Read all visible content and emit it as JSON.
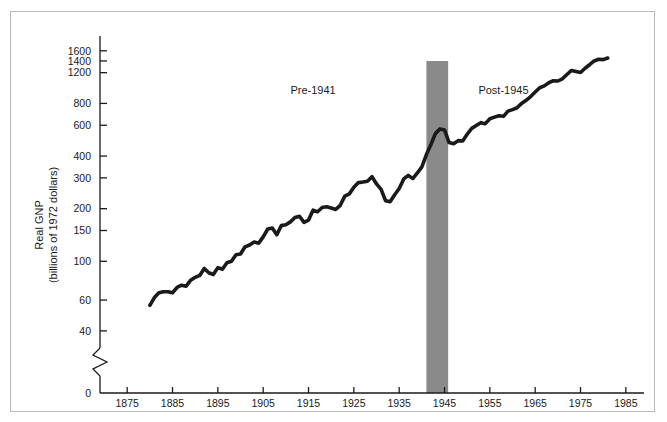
{
  "chart_data": {
    "type": "line",
    "title": "",
    "xlabel": "",
    "ylabel": "Real GNP",
    "ylabel_line2": "(billions of 1972 dollars)",
    "yscale": "log",
    "y_axis_break": true,
    "y_break_note": "axis broken between 0 and 40",
    "ylim": [
      35,
      1750
    ],
    "xlim": [
      1869,
      1989
    ],
    "grid": false,
    "legend": false,
    "yticks": [
      40,
      60,
      100,
      150,
      200,
      300,
      400,
      600,
      800,
      1200,
      1400,
      1600
    ],
    "ytick_labels": [
      "40",
      "60",
      "100",
      "150",
      "200",
      "300",
      "400",
      "600",
      "800",
      "1200",
      "1400",
      "1600"
    ],
    "y_zero_label": "0",
    "xticks": [
      1875,
      1885,
      1895,
      1905,
      1915,
      1925,
      1935,
      1945,
      1955,
      1965,
      1975,
      1985
    ],
    "xtick_labels": [
      "1875",
      "1885",
      "1895",
      "1905",
      "1915",
      "1925",
      "1935",
      "1945",
      "1955",
      "1965",
      "1975",
      "1985"
    ],
    "line_color": "#1a1a1a",
    "line_width": 3.6,
    "annotations": [
      {
        "text": "Pre-1941",
        "x": 1916,
        "y": 900,
        "name": "annotation-pre-1941"
      },
      {
        "text": "Post-1945",
        "x": 1958,
        "y": 900,
        "name": "annotation-post-1945"
      }
    ],
    "shaded_regions": [
      {
        "name": "wwii-band",
        "x_start": 1941,
        "x_end": 1945.8,
        "color": "#8a8a8a",
        "label": ""
      }
    ],
    "x": [
      1880,
      1881,
      1882,
      1883,
      1884,
      1885,
      1886,
      1887,
      1888,
      1889,
      1890,
      1891,
      1892,
      1893,
      1894,
      1895,
      1896,
      1897,
      1898,
      1899,
      1900,
      1901,
      1902,
      1903,
      1904,
      1905,
      1906,
      1907,
      1908,
      1909,
      1910,
      1911,
      1912,
      1913,
      1914,
      1915,
      1916,
      1917,
      1918,
      1919,
      1920,
      1921,
      1922,
      1923,
      1924,
      1925,
      1926,
      1927,
      1928,
      1929,
      1930,
      1931,
      1932,
      1933,
      1934,
      1935,
      1936,
      1937,
      1938,
      1939,
      1940,
      1941,
      1942,
      1943,
      1944,
      1945,
      1946,
      1947,
      1948,
      1949,
      1950,
      1951,
      1952,
      1953,
      1954,
      1955,
      1956,
      1957,
      1958,
      1959,
      1960,
      1961,
      1962,
      1963,
      1964,
      1965,
      1966,
      1967,
      1968,
      1969,
      1970,
      1971,
      1972,
      1973,
      1974,
      1975,
      1976,
      1977,
      1978,
      1979,
      1980,
      1981
    ],
    "y": [
      56,
      62,
      66,
      67,
      67,
      66,
      71,
      73,
      72,
      78,
      81,
      83,
      91,
      86,
      84,
      92,
      90,
      98,
      100,
      109,
      110,
      121,
      124,
      129,
      127,
      138,
      153,
      155,
      142,
      160,
      162,
      168,
      178,
      181,
      167,
      172,
      196,
      192,
      203,
      205,
      202,
      198,
      209,
      236,
      243,
      265,
      282,
      284,
      287,
      305,
      277,
      258,
      222,
      219,
      240,
      261,
      296,
      310,
      297,
      320,
      347,
      408,
      466,
      539,
      572,
      564,
      478,
      471,
      490,
      488,
      533,
      576,
      598,
      621,
      613,
      654,
      668,
      680,
      675,
      723,
      737,
      756,
      800,
      833,
      876,
      929,
      984,
      1008,
      1051,
      1078,
      1075,
      1107,
      1171,
      1235,
      1218,
      1202,
      1271,
      1332,
      1400,
      1431,
      1425,
      1455
    ]
  }
}
